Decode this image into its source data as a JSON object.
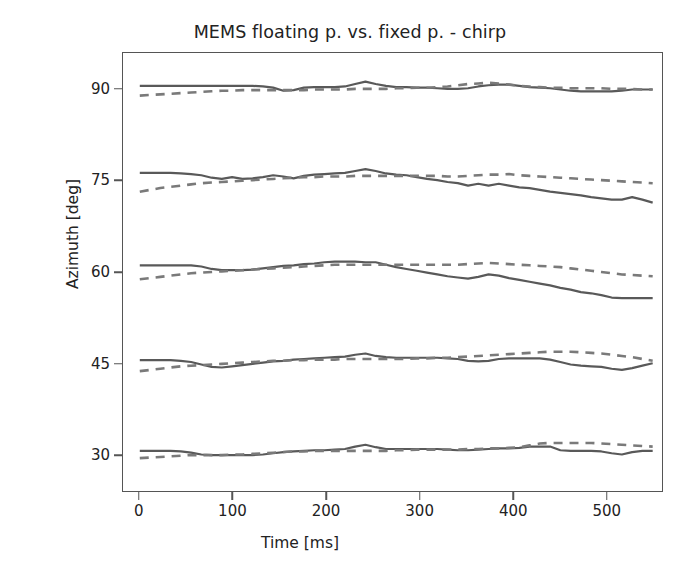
{
  "chart_data": {
    "type": "line",
    "title": "MEMS floating p. vs. fixed p. - chirp",
    "xlabel": "Time [ms]",
    "ylabel": "Azimuth [deg]",
    "xlim": [
      -18,
      560
    ],
    "ylim": [
      24,
      96
    ],
    "xticks": [
      0,
      100,
      200,
      300,
      400,
      500
    ],
    "xtick_labels": [
      "0",
      "100",
      "200",
      "300",
      "400",
      "500"
    ],
    "yticks": [
      30,
      45,
      60,
      75,
      90
    ],
    "ytick_labels": [
      "30",
      "45",
      "60",
      "75",
      "90"
    ],
    "grid": false,
    "legend": "none",
    "colors": {
      "solid_line": "#595959",
      "dashed_line": "#7a7a7a",
      "axis": "#555555",
      "text": "#222222",
      "background": "#ffffff"
    },
    "line_styles": {
      "fixed_p": "solid",
      "floating_p": "dashed"
    },
    "x": [
      0,
      11,
      22,
      33,
      44,
      55,
      66,
      77,
      88,
      99,
      110,
      121,
      132,
      143,
      154,
      165,
      176,
      187,
      198,
      209,
      220,
      231,
      242,
      253,
      264,
      275,
      286,
      297,
      308,
      319,
      330,
      341,
      352,
      363,
      374,
      385,
      396,
      407,
      418,
      429,
      440,
      451,
      462,
      473,
      484,
      495,
      506,
      517,
      528,
      539,
      550
    ],
    "series": [
      {
        "name": "fixed p. - 90 deg",
        "style": "solid",
        "nominal": 90,
        "values": [
          90.6,
          90.6,
          90.6,
          90.6,
          90.6,
          90.6,
          90.6,
          90.6,
          90.6,
          90.6,
          90.6,
          90.6,
          90.5,
          90.3,
          89.8,
          89.9,
          90.3,
          90.4,
          90.4,
          90.4,
          90.5,
          90.9,
          91.3,
          90.9,
          90.6,
          90.4,
          90.4,
          90.3,
          90.3,
          90.2,
          90.1,
          90.1,
          90.2,
          90.5,
          90.7,
          90.8,
          90.8,
          90.6,
          90.4,
          90.3,
          90.2,
          90.0,
          89.8,
          89.7,
          89.7,
          89.7,
          89.7,
          89.8,
          90.0,
          90.0,
          90.0
        ]
      },
      {
        "name": "floating p. - 90 deg",
        "style": "dashed",
        "nominal": 90,
        "values": [
          89.0,
          89.1,
          89.2,
          89.3,
          89.4,
          89.5,
          89.6,
          89.7,
          89.8,
          89.8,
          89.9,
          89.9,
          89.9,
          89.9,
          89.9,
          89.9,
          89.9,
          90.0,
          90.0,
          90.0,
          90.0,
          90.1,
          90.1,
          90.1,
          90.1,
          90.2,
          90.2,
          90.3,
          90.3,
          90.4,
          90.5,
          90.7,
          90.9,
          91.0,
          91.1,
          91.0,
          90.8,
          90.6,
          90.5,
          90.4,
          90.3,
          90.3,
          90.2,
          90.2,
          90.2,
          90.2,
          90.1,
          90.1,
          90.1,
          90.0,
          90.0
        ]
      },
      {
        "name": "fixed p. - 75 deg",
        "style": "solid",
        "nominal": 75,
        "values": [
          76.3,
          76.3,
          76.3,
          76.3,
          76.2,
          76.1,
          75.9,
          75.5,
          75.3,
          75.6,
          75.3,
          75.4,
          75.6,
          75.9,
          75.7,
          75.4,
          75.8,
          76.0,
          76.1,
          76.2,
          76.3,
          76.6,
          76.9,
          76.6,
          76.2,
          76.0,
          75.9,
          75.6,
          75.3,
          75.1,
          74.8,
          74.6,
          74.2,
          74.5,
          74.2,
          74.5,
          74.2,
          73.9,
          73.8,
          73.5,
          73.2,
          73.0,
          72.8,
          72.6,
          72.3,
          72.1,
          71.9,
          71.9,
          72.3,
          71.9,
          71.4
        ]
      },
      {
        "name": "floating p. - 75 deg",
        "style": "dashed",
        "nominal": 75,
        "values": [
          73.2,
          73.5,
          73.8,
          74.0,
          74.2,
          74.4,
          74.6,
          74.7,
          74.8,
          74.9,
          75.0,
          75.1,
          75.2,
          75.3,
          75.4,
          75.5,
          75.6,
          75.6,
          75.7,
          75.7,
          75.7,
          75.8,
          75.8,
          75.8,
          75.8,
          75.8,
          75.8,
          75.8,
          75.8,
          75.8,
          75.7,
          75.7,
          75.8,
          75.9,
          76.0,
          76.0,
          76.1,
          75.9,
          75.8,
          75.7,
          75.6,
          75.5,
          75.4,
          75.3,
          75.2,
          75.1,
          75.0,
          74.9,
          74.8,
          74.7,
          74.6
        ]
      },
      {
        "name": "fixed p. - 60 deg",
        "style": "solid",
        "nominal": 60,
        "values": [
          61.1,
          61.1,
          61.1,
          61.1,
          61.1,
          61.1,
          60.9,
          60.5,
          60.3,
          60.3,
          60.3,
          60.4,
          60.6,
          60.8,
          61.0,
          61.1,
          61.3,
          61.4,
          61.6,
          61.7,
          61.7,
          61.7,
          61.6,
          61.6,
          61.2,
          60.8,
          60.5,
          60.2,
          59.9,
          59.6,
          59.3,
          59.1,
          58.9,
          59.2,
          59.6,
          59.4,
          59.0,
          58.7,
          58.4,
          58.1,
          57.8,
          57.4,
          57.1,
          56.7,
          56.5,
          56.2,
          55.8,
          55.7,
          55.7,
          55.7,
          55.7
        ]
      },
      {
        "name": "floating p. - 60 deg",
        "style": "dashed",
        "nominal": 60,
        "values": [
          58.8,
          59.0,
          59.2,
          59.4,
          59.6,
          59.8,
          59.9,
          60.0,
          60.1,
          60.2,
          60.3,
          60.4,
          60.5,
          60.6,
          60.7,
          60.8,
          60.9,
          61.0,
          61.1,
          61.2,
          61.2,
          61.2,
          61.2,
          61.2,
          61.2,
          61.2,
          61.2,
          61.2,
          61.2,
          61.2,
          61.2,
          61.2,
          61.3,
          61.4,
          61.5,
          61.4,
          61.3,
          61.2,
          61.1,
          61.0,
          60.9,
          60.8,
          60.6,
          60.4,
          60.2,
          60.0,
          59.8,
          59.6,
          59.5,
          59.4,
          59.3
        ]
      },
      {
        "name": "fixed p. - 45 deg",
        "style": "solid",
        "nominal": 45,
        "values": [
          45.5,
          45.5,
          45.5,
          45.5,
          45.4,
          45.2,
          44.8,
          44.4,
          44.3,
          44.5,
          44.7,
          44.9,
          45.1,
          45.3,
          45.4,
          45.6,
          45.7,
          45.8,
          45.9,
          46.0,
          46.1,
          46.4,
          46.6,
          46.2,
          46.0,
          45.9,
          45.9,
          45.9,
          45.9,
          45.9,
          45.8,
          45.7,
          45.4,
          45.3,
          45.4,
          45.7,
          45.8,
          45.8,
          45.8,
          45.8,
          45.6,
          45.2,
          44.8,
          44.6,
          44.5,
          44.4,
          44.1,
          43.9,
          44.2,
          44.6,
          45.0
        ]
      },
      {
        "name": "floating p. - 45 deg",
        "style": "dashed",
        "nominal": 45,
        "values": [
          43.7,
          43.9,
          44.1,
          44.3,
          44.5,
          44.6,
          44.7,
          44.8,
          44.9,
          45.0,
          45.1,
          45.2,
          45.3,
          45.4,
          45.4,
          45.5,
          45.5,
          45.6,
          45.6,
          45.6,
          45.7,
          45.7,
          45.7,
          45.7,
          45.7,
          45.7,
          45.7,
          45.8,
          45.8,
          45.9,
          45.9,
          46.0,
          46.1,
          46.2,
          46.3,
          46.4,
          46.5,
          46.6,
          46.7,
          46.8,
          46.9,
          46.9,
          46.9,
          46.8,
          46.7,
          46.6,
          46.4,
          46.2,
          46.0,
          45.7,
          45.4
        ]
      },
      {
        "name": "fixed p. - 30 deg",
        "style": "solid",
        "nominal": 30,
        "values": [
          30.6,
          30.6,
          30.6,
          30.6,
          30.5,
          30.3,
          30.0,
          29.9,
          29.9,
          29.9,
          29.9,
          29.9,
          30.0,
          30.2,
          30.4,
          30.5,
          30.6,
          30.7,
          30.7,
          30.8,
          30.9,
          31.3,
          31.6,
          31.2,
          30.9,
          30.9,
          30.9,
          30.9,
          30.9,
          30.9,
          30.8,
          30.7,
          30.7,
          30.8,
          30.9,
          31.0,
          31.0,
          31.1,
          31.3,
          31.3,
          31.3,
          30.7,
          30.6,
          30.6,
          30.6,
          30.5,
          30.2,
          30.0,
          30.4,
          30.6,
          30.6
        ]
      },
      {
        "name": "floating p. - 30 deg",
        "style": "dashed",
        "nominal": 30,
        "values": [
          29.4,
          29.5,
          29.6,
          29.7,
          29.8,
          29.9,
          29.9,
          29.9,
          29.9,
          30.0,
          30.0,
          30.1,
          30.2,
          30.3,
          30.4,
          30.5,
          30.5,
          30.6,
          30.6,
          30.6,
          30.6,
          30.6,
          30.6,
          30.6,
          30.6,
          30.7,
          30.7,
          30.8,
          30.8,
          30.8,
          30.8,
          30.8,
          30.9,
          30.9,
          31.0,
          31.0,
          31.1,
          31.2,
          31.5,
          31.8,
          31.9,
          31.9,
          31.9,
          31.9,
          31.9,
          31.8,
          31.7,
          31.6,
          31.5,
          31.4,
          31.3
        ]
      }
    ]
  }
}
